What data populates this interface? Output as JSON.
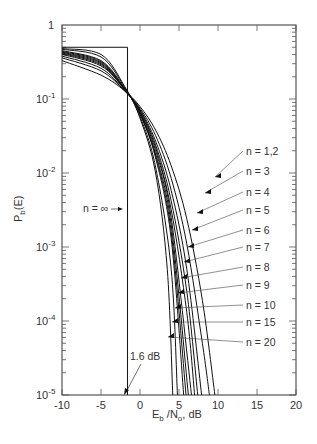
{
  "chart_data": {
    "type": "line",
    "title": "",
    "xlabel": "Eb/No, dB",
    "ylabel": "Pb(E)",
    "xlim": [
      -10,
      20
    ],
    "ylim": [
      1e-05,
      1
    ],
    "yscale": "log",
    "x_ticks": [
      "-10",
      "-5",
      "0",
      "5",
      "10",
      "15",
      "20"
    ],
    "y_ticks": [
      "1",
      "10^-1",
      "10^-2",
      "10^-3",
      "10^-4",
      "10^-5"
    ],
    "grid": false,
    "legend_position": "inline-annotations-right",
    "series": [
      {
        "name": "n = 1,2",
        "x": [
          -10,
          -5,
          -2,
          0,
          2,
          4,
          6,
          8,
          9.6
        ],
        "y": [
          0.33,
          0.21,
          0.13,
          0.079,
          0.038,
          0.0125,
          0.0024,
          0.00019,
          1e-05
        ]
      },
      {
        "name": "n = 3",
        "x": [
          -10,
          -5,
          -2,
          0,
          2,
          4,
          6,
          8,
          8.9
        ],
        "y": [
          0.36,
          0.24,
          0.13,
          0.075,
          0.032,
          0.0085,
          0.0011,
          5e-05,
          1e-05
        ]
      },
      {
        "name": "n = 4",
        "x": [
          -10,
          -5,
          -2,
          0,
          2,
          4,
          6,
          7.9
        ],
        "y": [
          0.38,
          0.26,
          0.13,
          0.072,
          0.027,
          0.0058,
          0.0005,
          1e-05
        ]
      },
      {
        "name": "n = 5",
        "x": [
          -10,
          -5,
          -2,
          0,
          2,
          4,
          6,
          7.4
        ],
        "y": [
          0.4,
          0.28,
          0.135,
          0.07,
          0.024,
          0.0042,
          0.00025,
          1e-05
        ]
      },
      {
        "name": "n = 6",
        "x": [
          -10,
          -5,
          -2,
          0,
          2,
          4,
          6,
          7.0
        ],
        "y": [
          0.41,
          0.29,
          0.135,
          0.068,
          0.022,
          0.0032,
          0.00013,
          1e-05
        ]
      },
      {
        "name": "n = 7",
        "x": [
          -10,
          -5,
          -2,
          0,
          2,
          4,
          6.6
        ],
        "y": [
          0.42,
          0.3,
          0.135,
          0.066,
          0.02,
          0.0025,
          1e-05
        ]
      },
      {
        "name": "n = 8",
        "x": [
          -10,
          -5,
          -2,
          0,
          2,
          4,
          6.2
        ],
        "y": [
          0.43,
          0.31,
          0.137,
          0.064,
          0.018,
          0.002,
          1e-05
        ]
      },
      {
        "name": "n = 9",
        "x": [
          -10,
          -5,
          -2,
          0,
          2,
          4,
          5.9
        ],
        "y": [
          0.44,
          0.32,
          0.138,
          0.063,
          0.017,
          0.0016,
          1e-05
        ]
      },
      {
        "name": "n = 10",
        "x": [
          -10,
          -5,
          -2,
          0,
          2,
          4,
          5.6
        ],
        "y": [
          0.45,
          0.33,
          0.14,
          0.062,
          0.016,
          0.0013,
          1e-05
        ]
      },
      {
        "name": "n = 15",
        "x": [
          -10,
          -5,
          -2,
          0,
          2,
          4,
          4.8
        ],
        "y": [
          0.47,
          0.37,
          0.145,
          0.058,
          0.012,
          0.0005,
          1e-05
        ]
      },
      {
        "name": "n = 20",
        "x": [
          -10,
          -5,
          -2,
          0,
          2,
          3.5,
          4.2
        ],
        "y": [
          0.48,
          0.4,
          0.15,
          0.055,
          0.01,
          0.0005,
          1e-05
        ]
      },
      {
        "name": "n = ∞",
        "x": [
          -10,
          -1.6,
          -1.6
        ],
        "y": [
          0.5,
          0.5,
          1e-05
        ]
      }
    ],
    "annotations": [
      "n = ∞",
      "1.6 dB",
      "n = 1,2",
      "n = 3",
      "n = 4",
      "n = 5",
      "n = 6",
      "n = 7",
      "n = 8",
      "n = 9",
      "n = 10",
      "n = 15",
      "n = 20"
    ]
  },
  "labels": {
    "y_tick_1": "1",
    "y_tick_base": "10",
    "y_exps": [
      "-1",
      "-2",
      "-3",
      "-4",
      "-5"
    ],
    "x_ticks": [
      "-10",
      "-5",
      "0",
      "5",
      "10",
      "15",
      "20"
    ],
    "xlabel_E": "E",
    "xlabel_b": "b",
    "xlabel_N": " /N",
    "xlabel_o": "o",
    "xlabel_rest": ", dB",
    "ylabel_P": "P",
    "ylabel_b": "b",
    "ylabel_rest": "(E)",
    "n_inf": "n = ∞",
    "db16": "1.6 dB",
    "n_labels": [
      "n = 1,2",
      "n = 3",
      "n = 4",
      "n = 5",
      "n = 6",
      "n = 7",
      "n = 8",
      "n = 9",
      "n = 10",
      "n = 15",
      "n = 20"
    ]
  }
}
